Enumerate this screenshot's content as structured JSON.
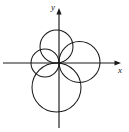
{
  "figure": {
    "kind": "math-diagram",
    "background_color": "#ffffff",
    "stroke_color": "#1a1a1a",
    "axes": {
      "x_label": "x",
      "y_label": "y",
      "origin": {
        "x": 59,
        "y": 63
      },
      "x_axis": {
        "from_x": 3,
        "to_x": 121,
        "y": 63,
        "arrow": "right"
      },
      "y_axis": {
        "from_y": 128,
        "to_y": 8,
        "x": 59,
        "arrow": "up"
      }
    },
    "circles": [
      {
        "name": "left-circle",
        "direction": "negative-x",
        "center_x": 45,
        "center_y": 63,
        "radius": 14
      },
      {
        "name": "top-circle",
        "direction": "positive-y",
        "center_x": 56.5,
        "center_y": 46.5,
        "radius": 16.5
      },
      {
        "name": "right-circle",
        "direction": "positive-x",
        "center_x": 79.5,
        "center_y": 62,
        "radius": 20.5
      },
      {
        "name": "bottom-circle",
        "direction": "negative-y",
        "center_x": 56.5,
        "center_y": 87.5,
        "radius": 24.5
      }
    ]
  },
  "chart_data": {
    "type": "line",
    "title": "",
    "xlabel": "x",
    "ylabel": "y",
    "grid": false,
    "legend": "none",
    "series": [
      {
        "name": "left-circle",
        "shape": "circle",
        "center": [
          -14,
          0
        ],
        "radius": 14
      },
      {
        "name": "top-circle",
        "shape": "circle",
        "center": [
          0,
          16.5
        ],
        "radius": 16.5
      },
      {
        "name": "right-circle",
        "shape": "circle",
        "center": [
          20.5,
          0
        ],
        "radius": 20.5
      },
      {
        "name": "bottom-circle",
        "shape": "circle",
        "center": [
          0,
          -24.5
        ],
        "radius": 24.5
      }
    ]
  }
}
